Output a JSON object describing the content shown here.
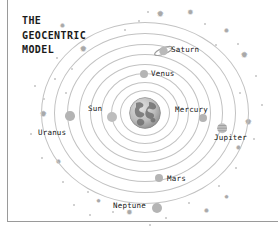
{
  "page": {
    "title_text": "THE\nGEOCENTRIC\nMODEL",
    "background_color": "#ffffff",
    "rule_color": "#9a9a9a",
    "orbit_color": "#c2c2c2",
    "body_color": "#b4b4b4",
    "label_color": "#141414",
    "decoration_color": "#c9c9c9"
  },
  "diagram": {
    "name": "geocentric-model-diagram",
    "center": {
      "label": "Earth",
      "cx": 145,
      "cy": 113,
      "r": 16
    },
    "orbits": [
      {
        "index": 1,
        "rx": 25,
        "ry": 23
      },
      {
        "index": 2,
        "rx": 34,
        "ry": 31
      },
      {
        "index": 3,
        "rx": 44,
        "ry": 40
      },
      {
        "index": 4,
        "rx": 55,
        "ry": 49
      },
      {
        "index": 5,
        "rx": 66,
        "ry": 59
      },
      {
        "index": 6,
        "rx": 78,
        "ry": 69
      },
      {
        "index": 7,
        "rx": 91,
        "ry": 80
      },
      {
        "index": 8,
        "rx": 104,
        "ry": 91
      }
    ],
    "bodies": [
      {
        "name": "sun",
        "label": "Sun",
        "type": "sun",
        "cx": 112,
        "cy": 117,
        "r": 5.0,
        "label_x": 88,
        "label_y": 104,
        "label_align": "left"
      },
      {
        "name": "mercury",
        "label": "Mercury",
        "type": "plain",
        "cx": 203,
        "cy": 118,
        "r": 4.0,
        "label_x": 175,
        "label_y": 105,
        "label_align": "left"
      },
      {
        "name": "venus",
        "label": "Venus",
        "type": "plain",
        "cx": 144,
        "cy": 74,
        "r": 4.2,
        "label_x": 151,
        "label_y": 69,
        "label_align": "left"
      },
      {
        "name": "mars",
        "label": "Mars",
        "type": "plain",
        "cx": 159,
        "cy": 178,
        "r": 4.4,
        "label_x": 167,
        "label_y": 174,
        "label_align": "left"
      },
      {
        "name": "jupiter",
        "label": "Jupiter",
        "type": "banded",
        "cx": 222,
        "cy": 124,
        "r": 5.2,
        "label_x": 214,
        "label_y": 133,
        "label_align": "left"
      },
      {
        "name": "saturn",
        "label": "Saturn",
        "type": "ringed",
        "cx": 163,
        "cy": 50,
        "r": 5.0,
        "label_x": 171,
        "label_y": 45,
        "label_align": "left"
      },
      {
        "name": "uranus",
        "label": "Uranus",
        "type": "plain",
        "cx": 70,
        "cy": 116,
        "r": 4.8,
        "label_x": 38,
        "label_y": 128,
        "label_align": "left"
      },
      {
        "name": "neptune",
        "label": "Neptune",
        "type": "plain",
        "cx": 157,
        "cy": 208,
        "r": 5.0,
        "label_x": 113,
        "label_y": 201,
        "label_align": "left"
      }
    ],
    "sparkles": [
      {
        "x": 63,
        "y": 27,
        "size": 7
      },
      {
        "x": 84,
        "y": 51,
        "size": 9
      },
      {
        "x": 161,
        "y": 16,
        "size": 9
      },
      {
        "x": 191,
        "y": 14,
        "size": 8
      },
      {
        "x": 227,
        "y": 32,
        "size": 7
      },
      {
        "x": 245,
        "y": 57,
        "size": 9
      },
      {
        "x": 44,
        "y": 116,
        "size": 9
      },
      {
        "x": 249,
        "y": 124,
        "size": 9
      },
      {
        "x": 239,
        "y": 149,
        "size": 7
      },
      {
        "x": 59,
        "y": 163,
        "size": 7
      },
      {
        "x": 99,
        "y": 202,
        "size": 6
      },
      {
        "x": 130,
        "y": 214,
        "size": 8
      },
      {
        "x": 207,
        "y": 212,
        "size": 7
      },
      {
        "x": 227,
        "y": 198,
        "size": 6
      }
    ],
    "dots": [
      {
        "x": 48,
        "y": 38,
        "d": 1.6
      },
      {
        "x": 74,
        "y": 39,
        "d": 1.4
      },
      {
        "x": 57,
        "y": 58,
        "d": 1.4
      },
      {
        "x": 72,
        "y": 69,
        "d": 2.0
      },
      {
        "x": 55,
        "y": 79,
        "d": 1.4
      },
      {
        "x": 66,
        "y": 93,
        "d": 1.6
      },
      {
        "x": 44,
        "y": 99,
        "d": 2.2
      },
      {
        "x": 35,
        "y": 86,
        "d": 1.4
      },
      {
        "x": 139,
        "y": 21,
        "d": 1.6
      },
      {
        "x": 125,
        "y": 30,
        "d": 1.4
      },
      {
        "x": 148,
        "y": 12,
        "d": 1.4
      },
      {
        "x": 205,
        "y": 24,
        "d": 1.4
      },
      {
        "x": 216,
        "y": 45,
        "d": 1.6
      },
      {
        "x": 238,
        "y": 44,
        "d": 1.4
      },
      {
        "x": 256,
        "y": 76,
        "d": 1.6
      },
      {
        "x": 240,
        "y": 93,
        "d": 1.6
      },
      {
        "x": 262,
        "y": 105,
        "d": 1.4
      },
      {
        "x": 254,
        "y": 139,
        "d": 1.6
      },
      {
        "x": 236,
        "y": 168,
        "d": 1.4
      },
      {
        "x": 219,
        "y": 186,
        "d": 1.6
      },
      {
        "x": 189,
        "y": 203,
        "d": 1.4
      },
      {
        "x": 166,
        "y": 218,
        "d": 1.4
      },
      {
        "x": 113,
        "y": 212,
        "d": 1.6
      },
      {
        "x": 88,
        "y": 192,
        "d": 1.6
      },
      {
        "x": 74,
        "y": 205,
        "d": 1.4
      },
      {
        "x": 63,
        "y": 182,
        "d": 1.4
      },
      {
        "x": 42,
        "y": 158,
        "d": 1.4
      },
      {
        "x": 31,
        "y": 134,
        "d": 1.6
      },
      {
        "x": 90,
        "y": 215,
        "d": 1.4
      },
      {
        "x": 150,
        "y": 225,
        "d": 1.4
      }
    ]
  }
}
